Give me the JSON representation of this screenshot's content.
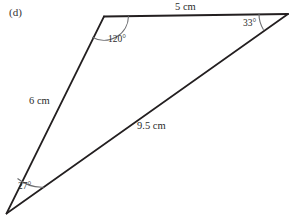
{
  "figure": {
    "part_label": "(d)",
    "shape": "triangle",
    "stroke_color": "#231f20",
    "arc_color": "#6d6e71",
    "background_color": "#ffffff",
    "vertices": [
      {
        "name": "top-left-vertex",
        "x": 104,
        "y": 16
      },
      {
        "name": "top-right-vertex",
        "x": 288,
        "y": 14
      },
      {
        "name": "bottom-left-vertex",
        "x": 6,
        "y": 214
      }
    ],
    "sides": [
      {
        "name": "top-side",
        "label": "5 cm",
        "value": 5,
        "unit": "cm",
        "from": "top-left-vertex",
        "to": "top-right-vertex"
      },
      {
        "name": "left-side",
        "label": "6 cm",
        "value": 6,
        "unit": "cm",
        "from": "top-left-vertex",
        "to": "bottom-left-vertex"
      },
      {
        "name": "diagonal-side",
        "label": "9.5 cm",
        "value": 9.5,
        "unit": "cm",
        "from": "bottom-left-vertex",
        "to": "top-right-vertex"
      }
    ],
    "angles": [
      {
        "name": "angle-top-left",
        "label": "120°",
        "value": 120,
        "at": "top-left-vertex"
      },
      {
        "name": "angle-top-right",
        "label": "33°",
        "value": 33,
        "at": "top-right-vertex"
      },
      {
        "name": "angle-bottom-left",
        "label": "27°",
        "value": 27,
        "at": "bottom-left-vertex"
      }
    ]
  }
}
